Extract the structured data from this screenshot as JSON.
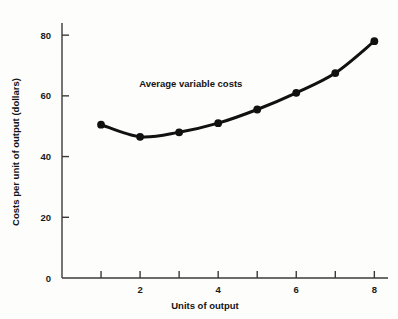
{
  "chart_data": {
    "type": "line",
    "title": "",
    "xlabel": "Units of output",
    "ylabel": "Costs per unit of output (dollars)",
    "xlim": [
      0,
      8.35
    ],
    "ylim": [
      0,
      84
    ],
    "grid": false,
    "legend_position": "none",
    "annotations": [
      {
        "text": "Average variable costs",
        "x": 3.3,
        "y": 63
      }
    ],
    "x_ticks": [
      1,
      2,
      3,
      4,
      5,
      6,
      7,
      8
    ],
    "x_tick_labels": [
      "",
      "2",
      "",
      "4",
      "",
      "6",
      "",
      "8"
    ],
    "y_ticks": [
      0,
      20,
      40,
      60,
      80
    ],
    "y_tick_labels": [
      "0",
      "20",
      "40",
      "60",
      "80"
    ],
    "series": [
      {
        "name": "Average variable costs",
        "marker": "filled-circle",
        "color": "#111111",
        "x": [
          1,
          2,
          3,
          4,
          5,
          6,
          7,
          8
        ],
        "values": [
          50.5,
          46.5,
          48.0,
          51.0,
          55.5,
          61.0,
          67.5,
          78.0
        ]
      }
    ]
  }
}
